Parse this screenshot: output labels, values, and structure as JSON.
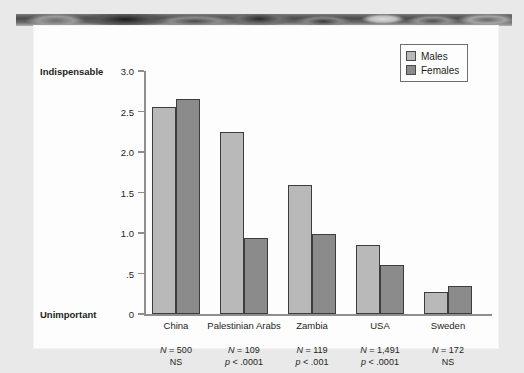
{
  "chart_data": {
    "type": "bar",
    "title": "",
    "xlabel": "",
    "ylabel": "",
    "ylim": [
      0,
      3.0
    ],
    "grid": false,
    "legend_position": "top-right",
    "axis_top_label": "Indispensable",
    "axis_bottom_label": "Unimportant",
    "ytick_labels": [
      "3.0",
      "2.5",
      "2.0",
      "1.5",
      "1.0",
      ".5",
      "0"
    ],
    "ytick_values": [
      3.0,
      2.5,
      2.0,
      1.5,
      1.0,
      0.5,
      0
    ],
    "categories": [
      "China",
      "Palestinian Arabs",
      "Zambia",
      "USA",
      "Sweden"
    ],
    "series": [
      {
        "name": "Males",
        "color": "#b9b9b9",
        "values": [
          2.55,
          2.25,
          1.59,
          0.85,
          0.27
        ]
      },
      {
        "name": "Females",
        "color": "#8b8b8b",
        "values": [
          2.65,
          0.94,
          0.99,
          0.6,
          0.35
        ]
      }
    ],
    "annotations": [
      {
        "n": "N = 500",
        "p": "NS"
      },
      {
        "n": "N = 109",
        "p": "p < .0001"
      },
      {
        "n": "N = 119",
        "p": "p < .001"
      },
      {
        "n": "N = 1,491",
        "p": "p < .0001"
      },
      {
        "n": "N = 172",
        "p": "NS"
      }
    ]
  }
}
